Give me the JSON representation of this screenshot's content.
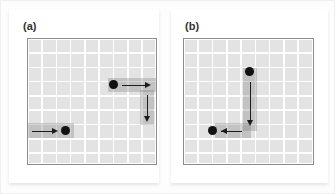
{
  "figure": {
    "background_color": "#ffffff",
    "panel_count": 2
  },
  "chart_data": {
    "type": "diagram",
    "title": "",
    "xlabel": "",
    "ylabel": "",
    "grid": true,
    "grid_columns": 9,
    "grid_rows": 9,
    "grid_line_color": "#ffffff",
    "plot_background_color": "#e3e3e3",
    "plot_border_color": "#8d8d8d",
    "marker_color": "#121212",
    "arrow_color": "#1c1c1c",
    "highlight_band_color": "#787878",
    "panels": [
      {
        "label": "(a)",
        "markers": [
          {
            "id": "marker-a1",
            "x": 6.0,
            "y": 3.2,
            "radius": 4.4
          },
          {
            "id": "marker-a2",
            "x": 2.6,
            "y": 6.4,
            "radius": 4.4
          }
        ],
        "arrows": [
          {
            "id": "arrow-a-right-top",
            "direction": "right",
            "from_x": 6.6,
            "from_y": 3.2,
            "to_x": 8.6,
            "to_y": 3.2
          },
          {
            "id": "arrow-a-down-right",
            "direction": "down",
            "from_x": 8.3,
            "from_y": 3.9,
            "to_x": 8.3,
            "to_y": 5.8
          },
          {
            "id": "arrow-a-right-bottom",
            "direction": "right",
            "from_x": 0.3,
            "from_y": 6.4,
            "to_x": 2.1,
            "to_y": 6.4
          }
        ],
        "bands": [
          {
            "id": "band-a-top-row",
            "orientation": "horizontal",
            "x": 5.6,
            "y": 2.7,
            "length": 3.4,
            "thickness": 1.0
          },
          {
            "id": "band-a-right-col",
            "orientation": "vertical",
            "x": 7.8,
            "y": 3.6,
            "length": 2.4,
            "thickness": 1.0
          },
          {
            "id": "band-a-bottom-row",
            "orientation": "horizontal",
            "x": 0.0,
            "y": 5.9,
            "length": 3.2,
            "thickness": 1.0
          }
        ]
      },
      {
        "label": "(b)",
        "markers": [
          {
            "id": "marker-b1",
            "x": 4.6,
            "y": 2.3,
            "radius": 4.4
          },
          {
            "id": "marker-b2",
            "x": 2.0,
            "y": 6.4,
            "radius": 4.4
          }
        ],
        "arrows": [
          {
            "id": "arrow-b-down",
            "direction": "down",
            "from_x": 4.6,
            "from_y": 3.0,
            "to_x": 4.6,
            "to_y": 6.1
          },
          {
            "id": "arrow-b-left",
            "direction": "left",
            "from_x": 4.4,
            "from_y": 6.4,
            "to_x": 2.6,
            "to_y": 6.4
          }
        ],
        "bands": [
          {
            "id": "band-b-col",
            "orientation": "vertical",
            "x": 4.1,
            "y": 2.0,
            "length": 4.4,
            "thickness": 1.0
          },
          {
            "id": "band-b-row",
            "orientation": "horizontal",
            "x": 2.2,
            "y": 5.9,
            "length": 2.5,
            "thickness": 1.0
          }
        ]
      }
    ]
  }
}
